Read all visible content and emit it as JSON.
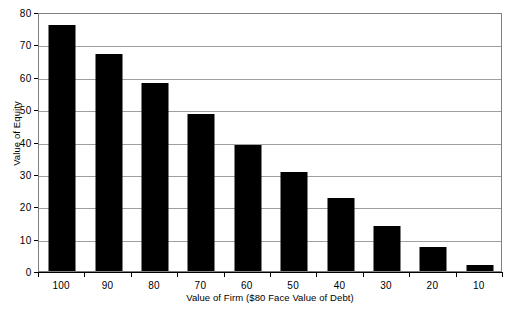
{
  "chart_data": {
    "type": "bar",
    "title": "",
    "xlabel": "Value of Firm ($80 Face Value of Debt)",
    "ylabel": "Value of Equity",
    "categories": [
      "100",
      "90",
      "80",
      "70",
      "60",
      "50",
      "40",
      "30",
      "20",
      "10"
    ],
    "values": [
      76,
      67,
      58,
      48.5,
      39,
      30.5,
      22.5,
      14,
      7.5,
      2
    ],
    "ylim": [
      0,
      80
    ],
    "yticks": [
      0,
      10,
      20,
      30,
      40,
      50,
      60,
      70,
      80
    ],
    "ytick_labels": [
      "0",
      "10",
      "20",
      "30",
      "40",
      "50",
      "60",
      "70",
      "80"
    ],
    "grid": true,
    "legend": false,
    "bar_color": "#000000",
    "gridline_color": "#a0a0a0",
    "plot_border_color": "#808080",
    "background_color": "#ffffff"
  }
}
